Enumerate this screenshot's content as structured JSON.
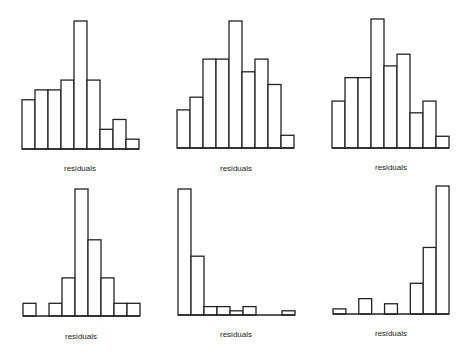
{
  "chart_data": [
    {
      "type": "bar",
      "title": "",
      "xlabel": "residuals",
      "ylabel": "",
      "bins": 9,
      "values": [
        5,
        6,
        6,
        7,
        13,
        7,
        2,
        3,
        1
      ],
      "ylim": [
        0,
        13
      ],
      "grid": false,
      "axes_visible": false
    },
    {
      "type": "bar",
      "title": "",
      "xlabel": "residuals",
      "ylabel": "",
      "bins": 9,
      "values": [
        3,
        4,
        7,
        7,
        10,
        6,
        7,
        5,
        1
      ],
      "ylim": [
        0,
        10
      ],
      "grid": false,
      "axes_visible": false
    },
    {
      "type": "bar",
      "title": "",
      "xlabel": "residuals",
      "ylabel": "",
      "bins": 9,
      "values": [
        4,
        6,
        6,
        11,
        7,
        8,
        3,
        4,
        1
      ],
      "ylim": [
        0,
        11
      ],
      "grid": false,
      "axes_visible": false
    },
    {
      "type": "bar",
      "title": "",
      "xlabel": "residuals",
      "ylabel": "",
      "bins": 9,
      "values": [
        1,
        0,
        1,
        3,
        10,
        6,
        3,
        1,
        1
      ],
      "ylim": [
        0,
        10
      ],
      "grid": false,
      "axes_visible": false
    },
    {
      "type": "bar",
      "title": "",
      "xlabel": "residuals",
      "ylabel": "",
      "bins": 9,
      "values": [
        30,
        14,
        2,
        2,
        1,
        2,
        0,
        0,
        1
      ],
      "ylim": [
        0,
        30
      ],
      "grid": false,
      "axes_visible": false
    },
    {
      "type": "bar",
      "title": "",
      "xlabel": "residuals",
      "ylabel": "",
      "bins": 9,
      "values": [
        1,
        0,
        3,
        0,
        2,
        0,
        6,
        13,
        25
      ],
      "ylim": [
        0,
        25
      ],
      "grid": false,
      "axes_visible": false
    }
  ]
}
